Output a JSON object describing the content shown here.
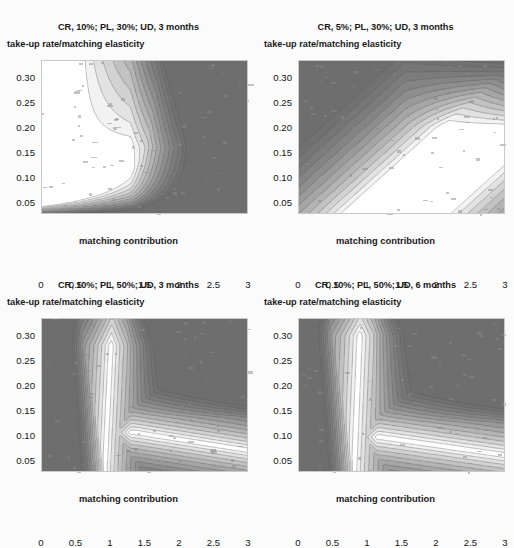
{
  "figure": {
    "background_color": "#fbfbfb",
    "layout": "2x2 grid of contour plots",
    "panel_count": 4
  },
  "palette": {
    "level_colors": [
      "#ffffff",
      "#f2f2f2",
      "#e2e2e2",
      "#d2d2d2",
      "#c2c2c2",
      "#b4b4b4",
      "#a6a6a6",
      "#9a9a9a",
      "#8e8e8e",
      "#848484",
      "#7c7c7c",
      "#767676",
      "#717171",
      "#6e6e6e"
    ],
    "contour_line_color": "#5a5a5a",
    "axis_border_color": "#c9c9c9",
    "text_color": "#1a1a1a"
  },
  "panels": [
    {
      "id": "panel-tl",
      "title": "CR, 10%; PL, 30%; UD, 3 months",
      "subtitle": "take-up rate/matching elasticity",
      "xlabel": "matching contribution",
      "ylabel": "",
      "xticks": [
        "0",
        "0.5",
        "1",
        "1.5",
        "2",
        "2.5",
        "3"
      ],
      "yticks": [
        "0.05",
        "0.10",
        "0.15",
        "0.20",
        "0.25",
        "0.30"
      ]
    },
    {
      "id": "panel-tr",
      "title": "CR, 5%; PL, 30%; UD, 3 months",
      "subtitle": "take-up rate/matching elasticity",
      "xlabel": "matching contribution",
      "ylabel": "",
      "xticks": [
        "0",
        "0.5",
        "1",
        "1.5",
        "2",
        "2.5",
        "3"
      ],
      "yticks": [
        "0.05",
        "0.10",
        "0.15",
        "0.20",
        "0.25",
        "0.30"
      ]
    },
    {
      "id": "panel-bl",
      "title": "CR, 10%; PL, 50%; UD, 3 months",
      "subtitle": "take-up rate/matching elasticity",
      "xlabel": "matching contribution",
      "ylabel": "",
      "xticks": [
        "0",
        "0.5",
        "1",
        "1.5",
        "2",
        "2.5",
        "3"
      ],
      "yticks": [
        "0.05",
        "0.10",
        "0.15",
        "0.20",
        "0.25",
        "0.30"
      ]
    },
    {
      "id": "panel-br",
      "title": "CR, 10%; PL, 50%; UD, 6 months",
      "subtitle": "take-up rate/matching elasticity",
      "xlabel": "matching contribution",
      "ylabel": "",
      "xticks": [
        "0",
        "0.5",
        "1",
        "1.5",
        "2",
        "2.5",
        "3"
      ],
      "yticks": [
        "0.05",
        "0.10",
        "0.15",
        "0.20",
        "0.25",
        "0.30"
      ]
    }
  ],
  "chart_data": [
    {
      "type": "heatmap",
      "subtype": "filled-contour",
      "title": "CR, 10%; PL, 30%; UD, 3 months",
      "subtitle": "take-up rate/matching elasticity",
      "xlabel": "matching contribution",
      "ylabel": "",
      "xlim": [
        0,
        3
      ],
      "ylim": [
        0.025,
        0.335
      ],
      "xticks": [
        0,
        0.5,
        1,
        1.5,
        2,
        2.5,
        3
      ],
      "yticks": [
        0.05,
        0.1,
        0.15,
        0.2,
        0.25,
        0.3
      ],
      "grid": false,
      "legend": "none",
      "colorscale": "grayscale: white = low ratio, dark gray = high ratio",
      "description": "Take-up rate to matching elasticity ratio. Low (white/light) values form an L-shaped valley running from upper-left down the diagonal and then rightward along the bottom edge; values rise steeply to a dark plateau covering the upper-right of the panel.",
      "contour_bands": [
        {
          "level_index": 0,
          "color": "#ffffff",
          "region": "small kernels near (1.15,0.115) and (1.5,0.045)"
        },
        {
          "level_index": 3,
          "color": "#d2d2d2",
          "region": "valley floor band"
        },
        {
          "level_index": 7,
          "color": "#9a9a9a",
          "region": "mid-slope"
        },
        {
          "level_index": 13,
          "color": "#6e6e6e",
          "region": "upper-right plateau"
        }
      ]
    },
    {
      "type": "heatmap",
      "subtype": "filled-contour",
      "title": "CR, 5%; PL, 30%; UD, 3 months",
      "subtitle": "take-up rate/matching elasticity",
      "xlabel": "matching contribution",
      "ylabel": "",
      "xlim": [
        0,
        3
      ],
      "ylim": [
        0.025,
        0.335
      ],
      "xticks": [
        0,
        0.5,
        1,
        1.5,
        2,
        2.5,
        3
      ],
      "yticks": [
        0.05,
        0.1,
        0.15,
        0.2,
        0.25,
        0.3
      ],
      "grid": false,
      "legend": "none",
      "colorscale": "grayscale: white = low ratio, dark gray = high ratio",
      "description": "Broad smooth diagonal bands. A wide light valley sweeps from the top-centre down to the lower-right corner with three white kernels along its axis; the left third and the far upper-right are uniformly dark.",
      "contour_bands": [
        {
          "level_index": 0,
          "color": "#ffffff",
          "region": "three kernels along diagonal at (1.35,0.30), (1.85,0.175), (2.45,0.075)"
        },
        {
          "level_index": 4,
          "color": "#c2c2c2",
          "region": "diagonal light band"
        },
        {
          "level_index": 9,
          "color": "#848484",
          "region": "left flank"
        },
        {
          "level_index": 13,
          "color": "#6e6e6e",
          "region": "left edge and upper-right corner"
        }
      ]
    },
    {
      "type": "heatmap",
      "subtype": "filled-contour",
      "title": "CR, 10%; PL, 50%; UD, 3 months",
      "subtitle": "take-up rate/matching elasticity",
      "xlabel": "matching contribution",
      "ylabel": "",
      "xlim": [
        0,
        3
      ],
      "ylim": [
        0.025,
        0.335
      ],
      "xticks": [
        0,
        0.5,
        1,
        1.5,
        2,
        2.5,
        3
      ],
      "yticks": [
        0.05,
        0.1,
        0.15,
        0.2,
        0.25,
        0.3
      ],
      "grid": false,
      "legend": "none",
      "colorscale": "grayscale: white = low ratio, dark gray = high ratio",
      "description": "Hook-shaped light valley: a narrow light finger rises near x=1 to y=0.27, bends right at about y=0.13 and widens into a broad white strip along the bottom edge to x=3. Dark plateau fills the upper right.",
      "contour_bands": [
        {
          "level_index": 0,
          "color": "#ffffff",
          "region": "finger tip near (1.05,0.26) and bottom strip 1.6-3.0"
        },
        {
          "level_index": 3,
          "color": "#d2d2d2",
          "region": "valley band"
        },
        {
          "level_index": 8,
          "color": "#8e8e8e",
          "region": "outer slope"
        },
        {
          "level_index": 13,
          "color": "#6e6e6e",
          "region": "upper-right plateau"
        }
      ]
    },
    {
      "type": "heatmap",
      "subtype": "filled-contour",
      "title": "CR, 10%; PL, 50%; UD, 6 months",
      "subtitle": "take-up rate/matching elasticity",
      "xlabel": "matching contribution",
      "ylabel": "",
      "xlim": [
        0,
        3
      ],
      "ylim": [
        0.025,
        0.335
      ],
      "xticks": [
        0,
        0.5,
        1,
        1.5,
        2,
        2.5,
        3
      ],
      "yticks": [
        0.05,
        0.1,
        0.15,
        0.2,
        0.25,
        0.3
      ],
      "grid": false,
      "legend": "none",
      "colorscale": "grayscale: white = low ratio, dark gray = high ratio",
      "description": "Similar hooked valley to the lower-left panel but shifted left and with a larger white lobe; the light finger reaches y=0.30 near x=0.85 and the bottom white strip extends from x=1.4 to x=3.",
      "contour_bands": [
        {
          "level_index": 0,
          "color": "#ffffff",
          "region": "upper lobe near (0.9,0.27) plus bottom strip 1.4-3.0"
        },
        {
          "level_index": 3,
          "color": "#d2d2d2",
          "region": "valley band"
        },
        {
          "level_index": 8,
          "color": "#8e8e8e",
          "region": "outer slope"
        },
        {
          "level_index": 13,
          "color": "#6e6e6e",
          "region": "upper-right plateau"
        }
      ]
    }
  ]
}
